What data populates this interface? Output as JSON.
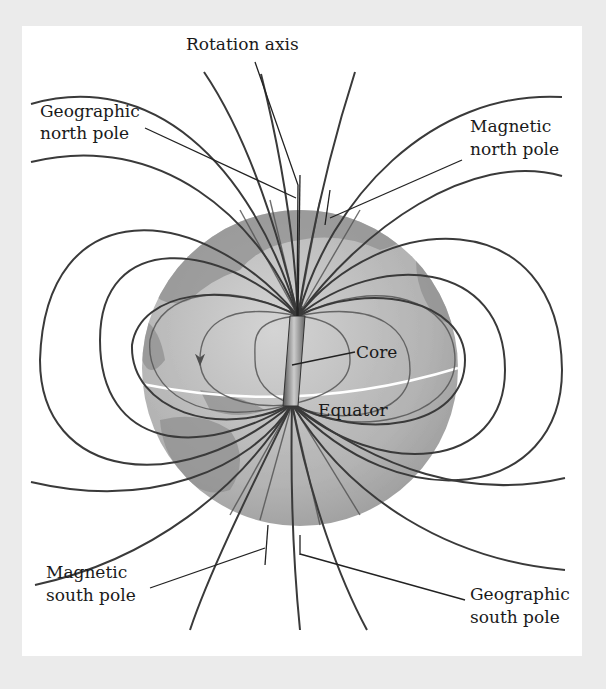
{
  "diagram": {
    "labels": {
      "rotation_axis": "Rotation axis",
      "geographic_north_1": "Geographic",
      "geographic_north_2": "north pole",
      "magnetic_north_1": "Magnetic",
      "magnetic_north_2": "north pole",
      "core": "Core",
      "equator": "Equator",
      "magnetic_south_1": "Magnetic",
      "magnetic_south_2": "south pole",
      "geographic_south_1": "Geographic",
      "geographic_south_2": "south pole"
    },
    "colors": {
      "background": "#ebebeb",
      "panel": "#ffffff",
      "globe_ocean": "#b9b9b9",
      "globe_land": "#8f8f8f",
      "field_line": "#3a3a3a",
      "equator": "#ffffff"
    }
  }
}
